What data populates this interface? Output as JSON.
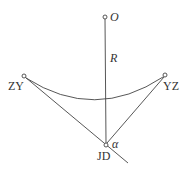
{
  "diagram": {
    "type": "circular-curve-geometry",
    "colors": {
      "stroke": "#444444",
      "text": "#333333",
      "background": "#ffffff"
    },
    "points": {
      "O": {
        "label": "O",
        "x": 105,
        "y": 17,
        "italic": true
      },
      "ZY": {
        "label": "ZY",
        "x": 24,
        "y": 76,
        "italic": false
      },
      "YZ": {
        "label": "YZ",
        "x": 165,
        "y": 75,
        "italic": false
      },
      "JD": {
        "label": "JD",
        "x": 106,
        "y": 145,
        "italic": false
      }
    },
    "labels": {
      "O": "O",
      "R": "R",
      "ZY": "ZY",
      "YZ": "YZ",
      "JD": "JD",
      "alpha": "α"
    },
    "edges": [
      {
        "name": "radius-line",
        "from": "O",
        "to": "JD"
      },
      {
        "name": "tangent-zy-jd",
        "from": "ZY",
        "to": "JD",
        "extended_to": [
          128,
          163
        ]
      },
      {
        "name": "tangent-yz-jd",
        "from": "YZ",
        "to": "JD"
      }
    ],
    "arc": {
      "from": "ZY",
      "to": "YZ",
      "bottom_y": 101
    }
  }
}
